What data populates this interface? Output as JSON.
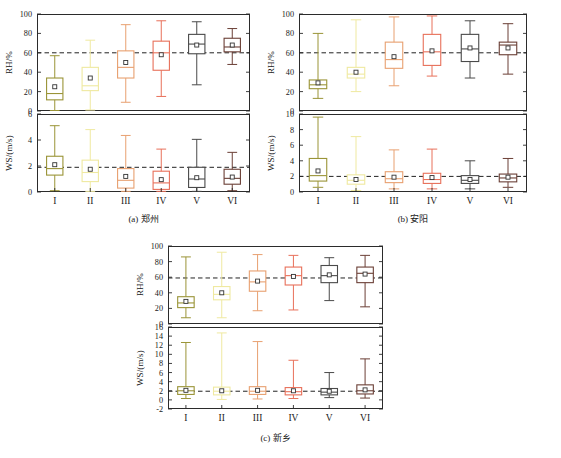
{
  "figure": {
    "categories": [
      "I",
      "II",
      "III",
      "IV",
      "V",
      "VI"
    ],
    "rh_axis_label": "RH/%",
    "ws_axis_label": "WS/(m/s)",
    "box_colors": [
      "#9a9437",
      "#efe9a0",
      "#e8a070",
      "#e8705a",
      "#4a4a4a",
      "#6b3f36"
    ],
    "ref_line_color": "#222222",
    "axis_color": "#2b2b2b"
  },
  "chart_data": [
    {
      "type": "box",
      "panel": "a",
      "caption": "(a) 郑州",
      "subplots": [
        {
          "name": "rh",
          "ylabel": "RH/%",
          "ylim": [
            0,
            100
          ],
          "yticks": [
            0,
            20,
            40,
            60,
            80,
            100
          ],
          "refline": 60,
          "grid": false,
          "categories": [
            "I",
            "II",
            "III",
            "IV",
            "V",
            "VI"
          ],
          "boxes": [
            {
              "category": "I",
              "whisker_low": 0.5,
              "q1": 11.5,
              "median": 18.0,
              "q3": 34.0,
              "whisker_high": 57.0,
              "mean": 25.0
            },
            {
              "category": "II",
              "whisker_low": 1.0,
              "q1": 21.0,
              "median": 26.0,
              "q3": 45.0,
              "whisker_high": 73.0,
              "mean": 34.0
            },
            {
              "category": "III",
              "whisker_low": 9.0,
              "q1": 34.0,
              "median": 45.0,
              "q3": 62.0,
              "whisker_high": 89.0,
              "mean": 50.0
            },
            {
              "category": "IV",
              "whisker_low": 15.0,
              "q1": 42.0,
              "median": 60.0,
              "q3": 72.0,
              "whisker_high": 93.0,
              "mean": 58.0
            },
            {
              "category": "V",
              "whisker_low": 27.0,
              "q1": 59.0,
              "median": 69.0,
              "q3": 79.0,
              "whisker_high": 92.0,
              "mean": 68.0
            },
            {
              "category": "VI",
              "whisker_low": 48.0,
              "q1": 61.0,
              "median": 66.0,
              "q3": 75.0,
              "whisker_high": 85.0,
              "mean": 68.0
            }
          ]
        },
        {
          "name": "ws",
          "ylabel": "WS/(m/s)",
          "ylim": [
            0,
            6
          ],
          "yticks": [
            0,
            2,
            4,
            6
          ],
          "refline": 1.9,
          "grid": false,
          "categories": [
            "I",
            "II",
            "III",
            "IV",
            "V",
            "VI"
          ],
          "boxes": [
            {
              "category": "I",
              "whisker_low": 0.1,
              "q1": 1.3,
              "median": 1.8,
              "q3": 2.75,
              "whisker_high": 5.1,
              "mean": 2.1
            },
            {
              "category": "II",
              "whisker_low": 0.05,
              "q1": 0.8,
              "median": 1.5,
              "q3": 2.45,
              "whisker_high": 4.8,
              "mean": 1.75
            },
            {
              "category": "III",
              "whisker_low": 0.05,
              "q1": 0.3,
              "median": 0.9,
              "q3": 1.8,
              "whisker_high": 4.35,
              "mean": 1.2
            },
            {
              "category": "IV",
              "whisker_low": 0.05,
              "q1": 0.2,
              "median": 0.7,
              "q3": 1.6,
              "whisker_high": 3.3,
              "mean": 0.95
            },
            {
              "category": "V",
              "whisker_low": 0.05,
              "q1": 0.35,
              "median": 1.0,
              "q3": 1.9,
              "whisker_high": 4.05,
              "mean": 1.1
            },
            {
              "category": "VI",
              "whisker_low": 0.1,
              "q1": 0.6,
              "median": 1.05,
              "q3": 1.75,
              "whisker_high": 3.05,
              "mean": 1.15
            }
          ]
        }
      ]
    },
    {
      "type": "box",
      "panel": "b",
      "caption": "(b) 安阳",
      "subplots": [
        {
          "name": "rh",
          "ylabel": "RH/%",
          "ylim": [
            0,
            100
          ],
          "yticks": [
            0,
            20,
            40,
            60,
            80,
            100
          ],
          "refline": 60,
          "grid": false,
          "categories": [
            "I",
            "II",
            "III",
            "IV",
            "V",
            "VI"
          ],
          "boxes": [
            {
              "category": "I",
              "whisker_low": 13.0,
              "q1": 23.0,
              "median": 27.0,
              "q3": 32.0,
              "whisker_high": 80.0,
              "mean": 29.0
            },
            {
              "category": "II",
              "whisker_low": 20.0,
              "q1": 34.0,
              "median": 38.0,
              "q3": 45.0,
              "whisker_high": 94.0,
              "mean": 40.0
            },
            {
              "category": "III",
              "whisker_low": 26.0,
              "q1": 44.0,
              "median": 53.0,
              "q3": 71.0,
              "whisker_high": 97.0,
              "mean": 56.0
            },
            {
              "category": "IV",
              "whisker_low": 36.0,
              "q1": 47.0,
              "median": 61.0,
              "q3": 79.0,
              "whisker_high": 98.0,
              "mean": 62.0
            },
            {
              "category": "V",
              "whisker_low": 34.0,
              "q1": 51.0,
              "median": 64.0,
              "q3": 79.0,
              "whisker_high": 93.0,
              "mean": 65.0
            },
            {
              "category": "VI",
              "whisker_low": 38.0,
              "q1": 58.0,
              "median": 68.0,
              "q3": 71.0,
              "whisker_high": 90.0,
              "mean": 65.0
            }
          ]
        },
        {
          "name": "ws",
          "ylabel": "WS/(m/s)",
          "ylim": [
            0,
            10
          ],
          "yticks": [
            0,
            2,
            4,
            6,
            8,
            10
          ],
          "refline": 2.0,
          "grid": false,
          "categories": [
            "I",
            "II",
            "III",
            "IV",
            "V",
            "VI"
          ],
          "boxes": [
            {
              "category": "I",
              "whisker_low": 0.6,
              "q1": 1.4,
              "median": 2.1,
              "q3": 4.3,
              "whisker_high": 9.6,
              "mean": 2.7
            },
            {
              "category": "II",
              "whisker_low": 0.2,
              "q1": 1.0,
              "median": 1.5,
              "q3": 2.2,
              "whisker_high": 7.1,
              "mean": 1.6
            },
            {
              "category": "III",
              "whisker_low": 0.4,
              "q1": 1.2,
              "median": 1.7,
              "q3": 2.6,
              "whisker_high": 5.4,
              "mean": 1.9
            },
            {
              "category": "IV",
              "whisker_low": 0.4,
              "q1": 1.1,
              "median": 1.6,
              "q3": 2.4,
              "whisker_high": 5.5,
              "mean": 1.85
            },
            {
              "category": "V",
              "whisker_low": 0.4,
              "q1": 1.1,
              "median": 1.5,
              "q3": 2.1,
              "whisker_high": 4.0,
              "mean": 1.6
            },
            {
              "category": "VI",
              "whisker_low": 0.6,
              "q1": 1.3,
              "median": 1.8,
              "q3": 2.3,
              "whisker_high": 4.3,
              "mean": 1.9
            }
          ]
        }
      ]
    },
    {
      "type": "box",
      "panel": "c",
      "caption": "(c) 新乡",
      "subplots": [
        {
          "name": "rh",
          "ylabel": "RH/%",
          "ylim": [
            0,
            100
          ],
          "yticks": [
            0,
            20,
            40,
            60,
            80,
            100
          ],
          "refline": 59,
          "grid": false,
          "categories": [
            "I",
            "II",
            "III",
            "IV",
            "V",
            "VI"
          ],
          "boxes": [
            {
              "category": "I",
              "whisker_low": 8.0,
              "q1": 21.0,
              "median": 27.0,
              "q3": 35.0,
              "whisker_high": 86.0,
              "mean": 29.0
            },
            {
              "category": "II",
              "whisker_low": 8.0,
              "q1": 31.0,
              "median": 38.0,
              "q3": 48.0,
              "whisker_high": 92.0,
              "mean": 40.0
            },
            {
              "category": "III",
              "whisker_low": 17.0,
              "q1": 42.0,
              "median": 54.0,
              "q3": 68.0,
              "whisker_high": 89.0,
              "mean": 55.0
            },
            {
              "category": "IV",
              "whisker_low": 18.0,
              "q1": 50.0,
              "median": 62.0,
              "q3": 73.0,
              "whisker_high": 88.0,
              "mean": 61.0
            },
            {
              "category": "V",
              "whisker_low": 30.0,
              "q1": 53.0,
              "median": 62.0,
              "q3": 75.0,
              "whisker_high": 85.0,
              "mean": 63.0
            },
            {
              "category": "VI",
              "whisker_low": 22.0,
              "q1": 53.0,
              "median": 65.0,
              "q3": 73.0,
              "whisker_high": 88.0,
              "mean": 64.0
            }
          ]
        },
        {
          "name": "ws",
          "ylabel": "WS/(m/s)",
          "ylim": [
            -2,
            16
          ],
          "yticks": [
            -2,
            0,
            2,
            4,
            6,
            8,
            10,
            12,
            14,
            16
          ],
          "refline": 1.9,
          "grid": false,
          "categories": [
            "I",
            "II",
            "III",
            "IV",
            "V",
            "VI"
          ],
          "boxes": [
            {
              "category": "I",
              "whisker_low": 0.3,
              "q1": 1.2,
              "median": 2.0,
              "q3": 2.9,
              "whisker_high": 12.6,
              "mean": 2.1
            },
            {
              "category": "II",
              "whisker_low": 0.1,
              "q1": 1.1,
              "median": 1.9,
              "q3": 2.8,
              "whisker_high": 14.7,
              "mean": 2.0
            },
            {
              "category": "III",
              "whisker_low": 0.2,
              "q1": 1.2,
              "median": 1.9,
              "q3": 2.9,
              "whisker_high": 12.8,
              "mean": 2.1
            },
            {
              "category": "IV",
              "whisker_low": 0.3,
              "q1": 1.1,
              "median": 1.8,
              "q3": 2.7,
              "whisker_high": 8.7,
              "mean": 2.0
            },
            {
              "category": "V",
              "whisker_low": 0.5,
              "q1": 1.1,
              "median": 1.7,
              "q3": 2.5,
              "whisker_high": 6.0,
              "mean": 1.9
            },
            {
              "category": "VI",
              "whisker_low": 0.4,
              "q1": 1.3,
              "median": 2.0,
              "q3": 3.3,
              "whisker_high": 9.0,
              "mean": 2.2
            }
          ]
        }
      ]
    }
  ]
}
